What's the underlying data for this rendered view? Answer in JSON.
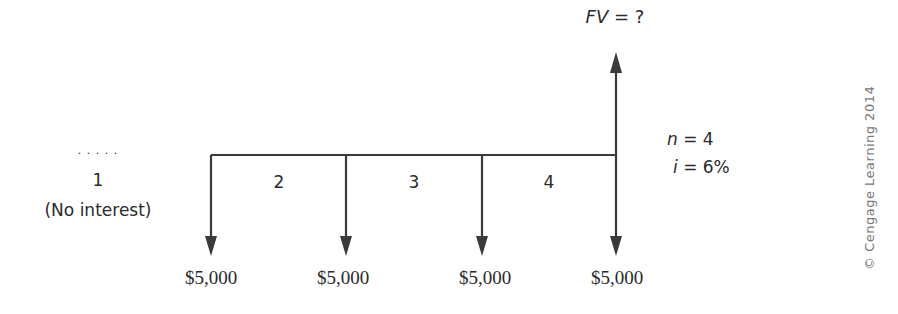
{
  "diagram": {
    "type": "cash-flow-timeline",
    "future_value_label": {
      "var": "FV",
      "rest": " = ?"
    },
    "dots": ". . . . .",
    "periods": [
      {
        "label": "1",
        "note": "(No interest)"
      },
      {
        "label": "2"
      },
      {
        "label": "3"
      },
      {
        "label": "4"
      }
    ],
    "payments": [
      "$5,000",
      "$5,000",
      "$5,000",
      "$5,000"
    ],
    "params": {
      "n": {
        "var": "n",
        "rest": " = 4"
      },
      "i": {
        "var": "i",
        "rest": " = 6%"
      }
    },
    "copyright": "© Cengage Learning 2014",
    "line_color": "#3a3a3a"
  }
}
